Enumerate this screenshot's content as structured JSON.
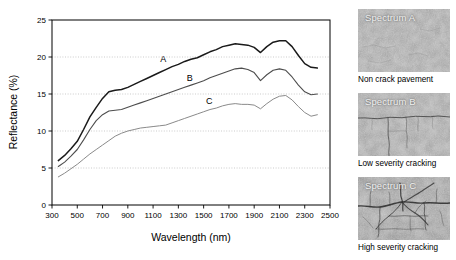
{
  "figure": {
    "title": "",
    "panels": [
      "spectra-chart",
      "pavement-photos"
    ]
  },
  "chart_data": {
    "type": "line",
    "title": "",
    "xlabel": "Wavelength (nm)",
    "ylabel": "Reflectance (%)",
    "xlim": [
      300,
      2500
    ],
    "ylim": [
      0,
      25
    ],
    "xticks": [
      300,
      500,
      700,
      900,
      1100,
      1300,
      1500,
      1700,
      1900,
      2100,
      2300,
      2500
    ],
    "yticks": [
      0,
      5,
      10,
      15,
      20,
      25
    ],
    "grid": "horizontal-dotted",
    "legend": "inline-labels",
    "series": [
      {
        "name": "A",
        "label": "A",
        "description": "Non crack pavement",
        "color": "#1a1a1a",
        "width": 1.5,
        "label_xy": [
          1180,
          19.3
        ],
        "x": [
          350,
          400,
          450,
          500,
          550,
          600,
          650,
          700,
          750,
          800,
          850,
          900,
          950,
          1000,
          1050,
          1100,
          1150,
          1200,
          1250,
          1300,
          1350,
          1400,
          1450,
          1500,
          1550,
          1600,
          1650,
          1700,
          1750,
          1800,
          1850,
          1900,
          1950,
          2000,
          2050,
          2100,
          2150,
          2200,
          2250,
          2300,
          2350,
          2400
        ],
        "y": [
          6.0,
          6.7,
          7.6,
          8.6,
          10.2,
          11.9,
          13.2,
          14.4,
          15.3,
          15.5,
          15.6,
          15.9,
          16.3,
          16.7,
          17.1,
          17.5,
          17.9,
          18.3,
          18.7,
          19.0,
          19.4,
          19.7,
          19.9,
          20.3,
          20.7,
          21.0,
          21.4,
          21.6,
          21.8,
          21.7,
          21.6,
          21.3,
          20.6,
          21.4,
          22.0,
          22.2,
          22.2,
          21.4,
          20.2,
          19.1,
          18.6,
          18.5
        ]
      },
      {
        "name": "B",
        "label": "B",
        "description": "Low severity cracking",
        "color": "#4d4d4d",
        "width": 1.1,
        "label_xy": [
          1390,
          16.7
        ],
        "x": [
          350,
          400,
          450,
          500,
          550,
          600,
          650,
          700,
          750,
          800,
          850,
          900,
          950,
          1000,
          1050,
          1100,
          1150,
          1200,
          1250,
          1300,
          1350,
          1400,
          1450,
          1500,
          1550,
          1600,
          1650,
          1700,
          1750,
          1800,
          1850,
          1900,
          1950,
          2000,
          2050,
          2100,
          2150,
          2200,
          2250,
          2300,
          2350,
          2400
        ],
        "y": [
          5.2,
          5.8,
          6.6,
          7.5,
          8.8,
          10.2,
          11.4,
          12.2,
          12.7,
          12.8,
          12.9,
          13.2,
          13.5,
          13.8,
          14.1,
          14.4,
          14.7,
          15.0,
          15.3,
          15.6,
          15.9,
          16.2,
          16.5,
          16.8,
          17.2,
          17.5,
          17.8,
          18.1,
          18.4,
          18.5,
          18.3,
          17.9,
          16.8,
          17.6,
          18.2,
          18.4,
          18.2,
          17.3,
          16.2,
          15.3,
          14.9,
          15.0
        ]
      },
      {
        "name": "C",
        "label": "C",
        "description": "High severity cracking",
        "color": "#8a8a8a",
        "width": 1.0,
        "label_xy": [
          1545,
          13.7
        ],
        "x": [
          350,
          400,
          450,
          500,
          550,
          600,
          650,
          700,
          750,
          800,
          850,
          900,
          950,
          1000,
          1050,
          1100,
          1150,
          1200,
          1250,
          1300,
          1350,
          1400,
          1450,
          1500,
          1550,
          1600,
          1650,
          1700,
          1750,
          1800,
          1850,
          1900,
          1950,
          2000,
          2050,
          2100,
          2150,
          2200,
          2250,
          2300,
          2350,
          2400
        ],
        "y": [
          3.8,
          4.3,
          4.9,
          5.5,
          6.2,
          6.9,
          7.5,
          8.1,
          8.7,
          9.3,
          9.7,
          10.0,
          10.2,
          10.4,
          10.5,
          10.6,
          10.7,
          10.8,
          11.1,
          11.4,
          11.7,
          12.0,
          12.3,
          12.6,
          12.9,
          13.1,
          13.4,
          13.6,
          13.7,
          13.6,
          13.6,
          13.5,
          13.0,
          13.7,
          14.3,
          14.7,
          14.8,
          14.2,
          13.3,
          12.5,
          12.0,
          12.2
        ]
      }
    ]
  },
  "photos": [
    {
      "id": "spectrum-a",
      "title": "Spectrum A",
      "caption": "Non crack pavement",
      "base_color": "#9b9b9b",
      "crack_level": "none"
    },
    {
      "id": "spectrum-b",
      "title": "Spectrum B",
      "caption": "Low severity cracking",
      "base_color": "#9a9a9a",
      "crack_level": "low"
    },
    {
      "id": "spectrum-c",
      "title": "Spectrum C",
      "caption": "High severity cracking",
      "base_color": "#8f8f8f",
      "crack_level": "high"
    }
  ]
}
